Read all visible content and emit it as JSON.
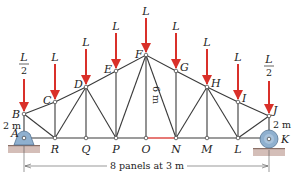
{
  "figure": {
    "colors": {
      "member": "#3a3a3a",
      "load": "#d9302a",
      "highlight_member": "#d9302a",
      "support": "#8fb0cf",
      "ground": "#b89a90",
      "joint": "#ffffff"
    },
    "joints": {
      "A": {
        "label": "A",
        "x": 24,
        "y": 138
      },
      "B": {
        "label": "B",
        "x": 24,
        "y": 114
      },
      "C": {
        "label": "C",
        "x": 55,
        "y": 102
      },
      "D": {
        "label": "D",
        "x": 86,
        "y": 87
      },
      "E": {
        "label": "E",
        "x": 116,
        "y": 71
      },
      "F": {
        "label": "F",
        "x": 146,
        "y": 55
      },
      "G": {
        "label": "G",
        "x": 176,
        "y": 71
      },
      "H": {
        "label": "H",
        "x": 207,
        "y": 87
      },
      "I": {
        "label": "I",
        "x": 238,
        "y": 102
      },
      "J": {
        "label": "J",
        "x": 269,
        "y": 116
      },
      "K": {
        "label": "K",
        "x": 269,
        "y": 138
      },
      "R": {
        "label": "R",
        "x": 55,
        "y": 138
      },
      "Q": {
        "label": "Q",
        "x": 86,
        "y": 138
      },
      "P": {
        "label": "P",
        "x": 116,
        "y": 138
      },
      "O": {
        "label": "O",
        "x": 146,
        "y": 138
      },
      "N": {
        "label": "N",
        "x": 176,
        "y": 138
      },
      "M": {
        "label": "M",
        "x": 207,
        "y": 138
      },
      "L": {
        "label": "L",
        "x": 238,
        "y": 138
      }
    },
    "loads": [
      {
        "joint": "B",
        "label_num": "L",
        "label_den": "2",
        "fraction": true
      },
      {
        "joint": "C",
        "label": "L"
      },
      {
        "joint": "D",
        "label": "L"
      },
      {
        "joint": "E",
        "label": "L"
      },
      {
        "joint": "F",
        "label": "L"
      },
      {
        "joint": "G",
        "label": "L"
      },
      {
        "joint": "H",
        "label": "L"
      },
      {
        "joint": "I",
        "label": "L"
      },
      {
        "joint": "J",
        "label_num": "L",
        "label_den": "2",
        "fraction": true
      }
    ],
    "dimensions": {
      "left_height": "2 m",
      "right_height": "2 m",
      "center_height": "6 m",
      "span": "8 panels at 3 m"
    },
    "highlighted_member": "ON"
  }
}
